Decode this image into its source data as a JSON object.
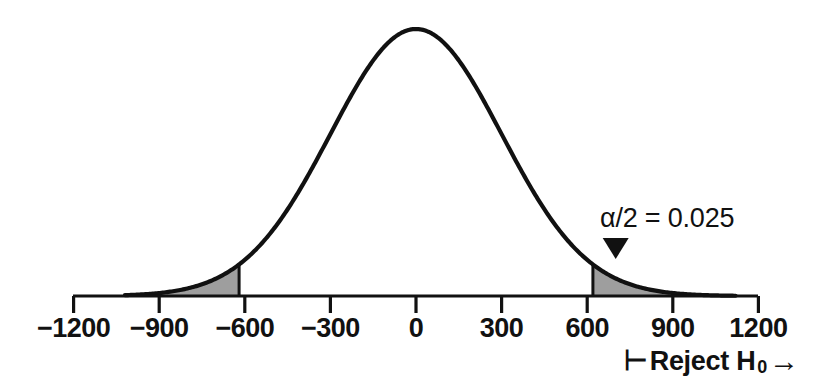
{
  "figure": {
    "background_color": "#ffffff",
    "curve_color": "#111111",
    "fill_color": "#9e9e9e",
    "axis_color": "#111111"
  },
  "annotations": {
    "alpha_label": "α/2 = 0.025",
    "marker_icon": "down-triangle-marker",
    "reject_prefix": "⊢",
    "reject_text": "Reject H",
    "reject_subscript": "0",
    "reject_arrow": "→"
  },
  "chart_data": {
    "type": "line",
    "title": "",
    "subtitle": "",
    "xlabel": "",
    "ylabel": "",
    "grid": false,
    "legend_position": "none",
    "distribution": "normal",
    "mean": 0,
    "std_dev": 300,
    "xlim": [
      -1200,
      1200
    ],
    "ylim": [
      0,
      1
    ],
    "xticks": [
      -1200,
      -900,
      -600,
      -300,
      0,
      300,
      600,
      900,
      1200
    ],
    "xtick_labels": [
      "−1200",
      "−900",
      "−600",
      "−300",
      "0",
      "300",
      "600",
      "900",
      "1200"
    ],
    "curve_x_range": [
      -1020,
      1120
    ],
    "critical_values": [
      -620,
      620
    ],
    "tail_area_each": 0.025,
    "total_alpha": 0.05,
    "confidence_level": 0.95,
    "shaded_regions": [
      {
        "name": "left-rejection-region",
        "from": -1020,
        "to": -620,
        "area": 0.025
      },
      {
        "name": "right-rejection-region",
        "from": 620,
        "to": 1120,
        "area": 0.025
      }
    ],
    "marker_x": 700,
    "x": [
      -1200,
      -1100,
      -1000,
      -900,
      -800,
      -700,
      -620,
      -600,
      -500,
      -400,
      -300,
      -200,
      -100,
      0,
      100,
      200,
      300,
      400,
      500,
      600,
      620,
      700,
      800,
      900,
      1000,
      1100,
      1200
    ],
    "values": [
      0.0,
      0.0001,
      0.004,
      0.011,
      0.028,
      0.063,
      0.097,
      0.135,
      0.249,
      0.411,
      0.607,
      0.801,
      0.946,
      1.0,
      0.946,
      0.801,
      0.607,
      0.411,
      0.249,
      0.135,
      0.097,
      0.063,
      0.028,
      0.011,
      0.004,
      0.0001,
      0.0
    ]
  }
}
